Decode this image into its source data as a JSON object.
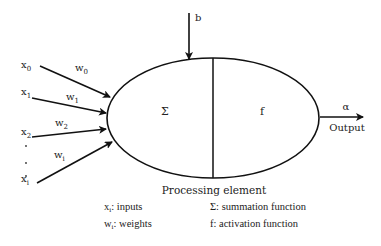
{
  "diagram": {
    "title": "Processing element",
    "bias_label": "b",
    "sum_symbol": "Σ",
    "activation_symbol": "f",
    "output_symbol": "α",
    "output_label": "Output",
    "inputs": [
      {
        "var": "x",
        "sub": "0",
        "weight_var": "w",
        "weight_sub": "0"
      },
      {
        "var": "x",
        "sub": "1",
        "weight_var": "w",
        "weight_sub": "1"
      },
      {
        "var": "x",
        "sub": "2",
        "weight_var": "w",
        "weight_sub": "2"
      },
      {
        "var": "x",
        "sub": "i",
        "weight_var": "w",
        "weight_sub": "i"
      }
    ],
    "ellipsis": "·"
  },
  "legend": {
    "inputs": {
      "var": "x",
      "sub": "i",
      "text": ": inputs"
    },
    "weights": {
      "var": "w",
      "sub": "i",
      "text": ": weights"
    },
    "summation": "Σ: summation function",
    "activation": "f: activation function"
  },
  "colors": {
    "stroke": "#111111",
    "text": "#222222",
    "background": "#ffffff"
  }
}
